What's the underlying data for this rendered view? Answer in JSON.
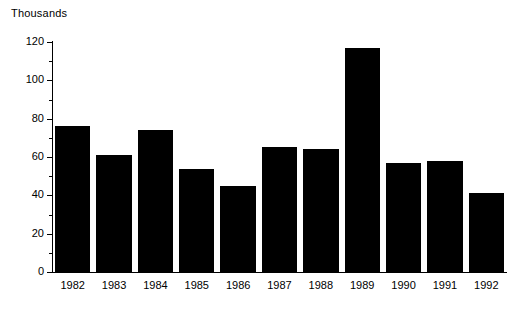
{
  "chart_data": {
    "type": "bar",
    "title": "",
    "ylabel": "Thousands",
    "xlabel": "",
    "categories": [
      "1982",
      "1983",
      "1984",
      "1985",
      "1986",
      "1987",
      "1988",
      "1989",
      "1990",
      "1991",
      "1992"
    ],
    "values": [
      76,
      61,
      74,
      54,
      45,
      65,
      64,
      117,
      57,
      58,
      41
    ],
    "ylim": [
      0,
      120
    ],
    "y_ticks": [
      0,
      20,
      40,
      60,
      80,
      100,
      120
    ],
    "y_tick_labels": [
      "0",
      "20",
      "40",
      "60",
      "80",
      "100",
      "120"
    ],
    "y_minor_tick_step": 10,
    "grid": false,
    "legend": null,
    "bar_color": "#000000",
    "axis_color": "#000000",
    "background_color": "#ffffff"
  },
  "axis_title": "Thousands"
}
